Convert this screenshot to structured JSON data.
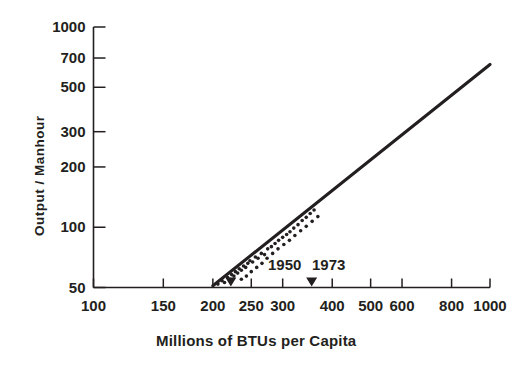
{
  "chart_data": {
    "type": "scatter",
    "title": "",
    "subtitle": "",
    "xlabel": "Millions of BTUs per Capita",
    "ylabel": "Output / Manhour",
    "xscale": "log",
    "yscale": "log",
    "xlim": [
      100,
      1000
    ],
    "ylim": [
      50,
      1000
    ],
    "grid": false,
    "legend": null,
    "xticks": [
      100,
      150,
      200,
      250,
      300,
      400,
      500,
      600,
      800,
      1000
    ],
    "xticklabels": [
      "100",
      "150",
      "200",
      "250",
      "300",
      "400",
      "500",
      "600",
      "800",
      "1000"
    ],
    "yticks": [
      50,
      100,
      200,
      300,
      500,
      700,
      1000
    ],
    "yticklabels": [
      "50",
      "100",
      "200",
      "300",
      "500",
      "700",
      "1000"
    ],
    "series": [
      {
        "name": "trend-line",
        "type": "line",
        "points": [
          {
            "x": 200,
            "y": 51
          },
          {
            "x": 1000,
            "y": 650
          }
        ]
      },
      {
        "name": "data-points",
        "type": "scatter",
        "points": [
          {
            "x": 206,
            "y": 52
          },
          {
            "x": 211,
            "y": 54
          },
          {
            "x": 214,
            "y": 53
          },
          {
            "x": 218,
            "y": 56
          },
          {
            "x": 221,
            "y": 55
          },
          {
            "x": 223,
            "y": 58
          },
          {
            "x": 226,
            "y": 57
          },
          {
            "x": 228,
            "y": 60
          },
          {
            "x": 231,
            "y": 59
          },
          {
            "x": 233,
            "y": 62
          },
          {
            "x": 236,
            "y": 61
          },
          {
            "x": 239,
            "y": 64
          },
          {
            "x": 242,
            "y": 63
          },
          {
            "x": 245,
            "y": 66
          },
          {
            "x": 248,
            "y": 68
          },
          {
            "x": 252,
            "y": 67
          },
          {
            "x": 256,
            "y": 71
          },
          {
            "x": 260,
            "y": 70
          },
          {
            "x": 265,
            "y": 74
          },
          {
            "x": 270,
            "y": 73
          },
          {
            "x": 275,
            "y": 78
          },
          {
            "x": 281,
            "y": 80
          },
          {
            "x": 287,
            "y": 83
          },
          {
            "x": 293,
            "y": 86
          },
          {
            "x": 300,
            "y": 89
          },
          {
            "x": 307,
            "y": 92
          },
          {
            "x": 313,
            "y": 95
          },
          {
            "x": 320,
            "y": 99
          },
          {
            "x": 328,
            "y": 103
          },
          {
            "x": 336,
            "y": 108
          },
          {
            "x": 344,
            "y": 112
          },
          {
            "x": 352,
            "y": 117
          },
          {
            "x": 360,
            "y": 122
          },
          {
            "x": 236,
            "y": 55
          },
          {
            "x": 243,
            "y": 57
          },
          {
            "x": 250,
            "y": 60
          },
          {
            "x": 258,
            "y": 63
          },
          {
            "x": 266,
            "y": 66
          },
          {
            "x": 274,
            "y": 70
          },
          {
            "x": 283,
            "y": 74
          },
          {
            "x": 292,
            "y": 78
          },
          {
            "x": 302,
            "y": 82
          },
          {
            "x": 312,
            "y": 86
          },
          {
            "x": 322,
            "y": 91
          },
          {
            "x": 333,
            "y": 96
          },
          {
            "x": 344,
            "y": 101
          },
          {
            "x": 356,
            "y": 107
          },
          {
            "x": 368,
            "y": 113
          }
        ]
      }
    ],
    "annotations": [
      {
        "label": "1950",
        "x": 222,
        "marker": "down-triangle"
      },
      {
        "label": "1973",
        "x": 355,
        "marker": "down-triangle"
      }
    ]
  },
  "axis": {
    "y_title": "Output / Manhour",
    "x_title": "Millions of BTUs per Capita"
  },
  "colors": {
    "ink": "#231f20",
    "background": "#ffffff"
  }
}
